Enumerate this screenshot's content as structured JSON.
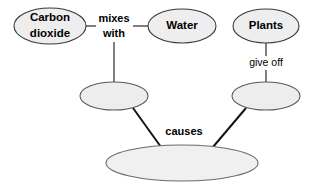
{
  "diagram": {
    "type": "concept-map",
    "background_color": "#ffffff",
    "node_fill_color": "#eeeeee",
    "node_stroke_color": "#3a3a3a",
    "connector_color": "#141414",
    "nodes": [
      {
        "id": "carbon-dioxide",
        "label_line1": "Carbon",
        "label_line2": "dioxide",
        "cx": 50,
        "cy": 26,
        "rx": 36,
        "ry": 18,
        "empty": false
      },
      {
        "id": "water",
        "label_line1": "Water",
        "label_line2": "",
        "cx": 182,
        "cy": 26,
        "rx": 34,
        "ry": 17,
        "empty": false
      },
      {
        "id": "plants",
        "label_line1": "Plants",
        "label_line2": "",
        "cx": 266,
        "cy": 26,
        "rx": 33,
        "ry": 17,
        "empty": false
      },
      {
        "id": "blank-left",
        "label_line1": "",
        "label_line2": "",
        "cx": 114,
        "cy": 96,
        "rx": 34,
        "ry": 14,
        "empty": true
      },
      {
        "id": "blank-right",
        "label_line1": "",
        "label_line2": "",
        "cx": 266,
        "cy": 96,
        "rx": 34,
        "ry": 14,
        "empty": true
      },
      {
        "id": "blank-bottom",
        "label_line1": "",
        "label_line2": "",
        "cx": 182,
        "cy": 163,
        "rx": 76,
        "ry": 18,
        "empty": true
      }
    ],
    "connector_labels": [
      {
        "id": "mixes-with",
        "line1": "mixes",
        "line2": "with",
        "x": 114,
        "y1": 19,
        "y2": 34,
        "from": "carbon-dioxide",
        "to": "water"
      },
      {
        "id": "give-off",
        "line1": "give off",
        "line2": "",
        "x": 266,
        "y1": 63,
        "y2": 0,
        "from": "plants",
        "to": "blank-right"
      },
      {
        "id": "causes",
        "line1": "causes",
        "line2": "",
        "x": 184,
        "y1": 132,
        "y2": 0,
        "from": "blank-left",
        "to": "blank-bottom"
      }
    ],
    "edges": [
      {
        "id": "edge-co2-to-mixes",
        "x1": 86,
        "y1": 26,
        "x2": 98,
        "y2": 26,
        "style": "thin"
      },
      {
        "id": "edge-mixes-to-water",
        "x1": 132,
        "y1": 26,
        "x2": 148,
        "y2": 26,
        "style": "thin"
      },
      {
        "id": "edge-mixes-to-blank-left",
        "x1": 114,
        "y1": 42,
        "x2": 114,
        "y2": 82,
        "style": "thin"
      },
      {
        "id": "edge-plants-to-giveoff",
        "x1": 266,
        "y1": 43,
        "x2": 266,
        "y2": 56,
        "style": "thin"
      },
      {
        "id": "edge-giveoff-to-blank-right",
        "x1": 266,
        "y1": 70,
        "x2": 266,
        "y2": 82,
        "style": "thin"
      },
      {
        "id": "edge-blank-left-to-bottom",
        "x1": 133,
        "y1": 108,
        "x2": 161,
        "y2": 147,
        "style": "thick"
      },
      {
        "id": "edge-blank-right-to-bottom",
        "x1": 246,
        "y1": 108,
        "x2": 213,
        "y2": 147,
        "style": "thick"
      }
    ]
  }
}
